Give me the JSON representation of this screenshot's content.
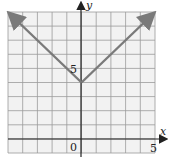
{
  "chart_data": {
    "type": "line",
    "title": "",
    "xlabel": "x",
    "ylabel": "y",
    "xlim": [
      -5,
      5
    ],
    "ylim": [
      -1,
      9
    ],
    "grid": true,
    "legend": null,
    "tick_labels": {
      "origin": "0",
      "x_tick": "5",
      "y_tick": "5"
    },
    "series": [
      {
        "name": "y = |x| + 4",
        "x": [
          -5,
          0,
          5
        ],
        "y": [
          9,
          4,
          9
        ],
        "arrows": "both ends"
      }
    ],
    "colors": {
      "line": "#7a7a7a",
      "grid": "#9a9a9a",
      "axes": "#222222",
      "background": "#f2f2f2"
    }
  },
  "labels": {
    "x_axis": "x",
    "y_axis": "y",
    "origin": "0",
    "x_five": "5",
    "y_five": "5"
  }
}
